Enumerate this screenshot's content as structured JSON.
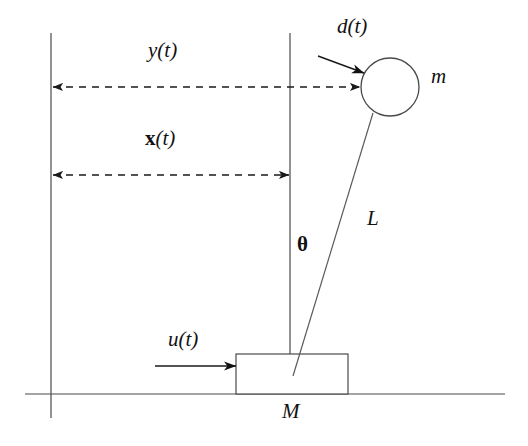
{
  "figure": {
    "background_color": "#ffffff",
    "line_color": "#3a3a3a",
    "text_color": "#111111",
    "width": 528,
    "height": 446
  },
  "labels": {
    "output_position": "y(t)",
    "cart_position": "x(t)",
    "disturbance": "d(t)",
    "control_input": "u(t)",
    "pendulum_mass": "m",
    "cart_mass": "M",
    "rod_length": "L",
    "angle": "θ"
  },
  "geometry": {
    "reference_line_left_x": 51,
    "reference_line_center_x": 290,
    "ground_line_y": 394,
    "ground_line_x_start": 25,
    "ground_line_x_end": 505,
    "cart": {
      "x": 236,
      "y": 354,
      "width": 112,
      "height": 40
    },
    "pivot": {
      "x": 293,
      "y": 376
    },
    "bob": {
      "cx": 390,
      "cy": 87,
      "r": 29
    },
    "y_dimension_line_y": 87,
    "x_dimension_line_y": 175,
    "u_arrow_y": 366,
    "u_arrow_x_start": 155,
    "u_arrow_x_end": 236,
    "d_arrow": {
      "x1": 318,
      "y1": 56,
      "x2": 363,
      "y2": 73
    }
  },
  "label_positions": {
    "output_position": {
      "left": 148,
      "top": 40,
      "size": 21
    },
    "cart_position": {
      "left": 145,
      "top": 128,
      "size": 21
    },
    "disturbance": {
      "left": 337,
      "top": 16,
      "size": 21
    },
    "control_input": {
      "left": 168,
      "top": 329,
      "size": 21
    },
    "pendulum_mass": {
      "left": 431,
      "top": 66,
      "size": 21
    },
    "cart_mass": {
      "left": 282,
      "top": 401,
      "size": 21
    },
    "rod_length": {
      "left": 367,
      "top": 208,
      "size": 21
    },
    "angle": {
      "left": 297,
      "top": 234,
      "size": 21
    }
  }
}
